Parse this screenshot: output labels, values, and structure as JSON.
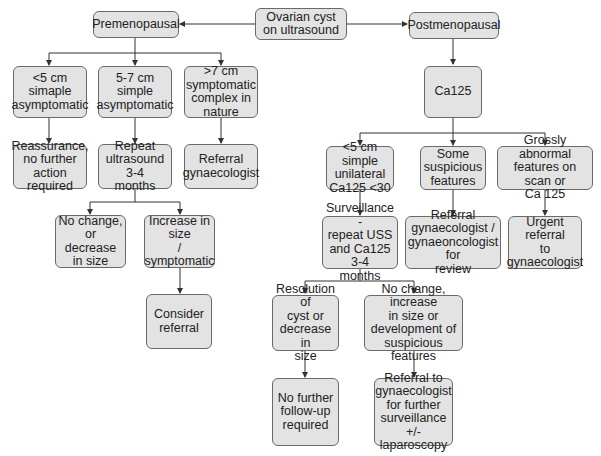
{
  "diagram": {
    "type": "flowchart",
    "nodes": {
      "root": "Ovarian cyst\non ultrasound",
      "pre": "Premenopausal",
      "post": "Postmenopausal",
      "pre_a": "<5 cm simaple\nasymptomatic",
      "pre_b": "5-7 cm simple\nasymptomatic",
      "pre_c": ">7 cm\nsymptomatic\ncomplex in\nnature",
      "pre_a1": "Reassurance,\nno further\naction required",
      "pre_b1": "Repeat\nultrasound 3-4\nmonths",
      "pre_c1": "Referral\ngynaecologist",
      "pre_b1a": "No change, or\ndecrease\nin size",
      "pre_b1b": "Increase in\nsize\n/ symptomatic",
      "pre_b1b1": "Consider\nreferral",
      "ca125": "Ca125",
      "post_a": "<5 cm simple\nunilateral\nCa125 <30",
      "post_b": "Some\nsuspicious\nfeatures",
      "post_c": "Grossly abnormal\nfeatures on scan or\nCa 125",
      "post_a1": "Surveillance -\nrepeat USS\nand Ca125 3-4\nmonths",
      "post_b1": "Referral\ngynaecologist /\ngynaeoncologist for\nreview",
      "post_c1": "Urgent referral\nto\ngynaecologist",
      "post_a1a": "Resolution of\ncyst or\ndecrease in\nsize",
      "post_a1b": "No change, increase\nin size or\ndevelopment of\nsuspicious features",
      "post_a1a1": "No further\nfollow-up\nrequired",
      "post_a1b1": "Referral to\ngynaecologist\nfor further\nsurveillance\n+/- laparoscopy"
    },
    "edges": [
      [
        "root",
        "pre"
      ],
      [
        "root",
        "post"
      ],
      [
        "pre",
        "pre_a"
      ],
      [
        "pre",
        "pre_b"
      ],
      [
        "pre",
        "pre_c"
      ],
      [
        "pre_a",
        "pre_a1"
      ],
      [
        "pre_b",
        "pre_b1"
      ],
      [
        "pre_c",
        "pre_c1"
      ],
      [
        "pre_b1",
        "pre_b1a"
      ],
      [
        "pre_b1",
        "pre_b1b"
      ],
      [
        "pre_b1b",
        "pre_b1b1"
      ],
      [
        "post",
        "ca125"
      ],
      [
        "ca125",
        "post_a"
      ],
      [
        "ca125",
        "post_b"
      ],
      [
        "ca125",
        "post_c"
      ],
      [
        "post_a",
        "post_a1"
      ],
      [
        "post_b",
        "post_b1"
      ],
      [
        "post_c",
        "post_c1"
      ],
      [
        "post_a1",
        "post_a1a"
      ],
      [
        "post_a1",
        "post_a1b"
      ],
      [
        "post_a1a",
        "post_a1a1"
      ],
      [
        "post_a1b",
        "post_a1b1"
      ]
    ],
    "colors": {
      "box_fill": "#e3e3e3",
      "box_border": "#6a6a6a",
      "line": "#333333"
    }
  }
}
